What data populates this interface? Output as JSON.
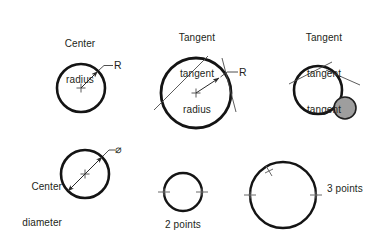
{
  "figure": {
    "title_visible": false,
    "background_color": "#ffffff",
    "stroke_color": "#1a1a1a",
    "thin_stroke_color": "#3b3b3b",
    "accent_fill_color": "#9e9e9e",
    "text_color": "#231f20"
  },
  "groups": [
    {
      "id": "center-radius",
      "caption_lines": [
        "Center",
        "radius"
      ],
      "dimension_label": "R",
      "circle": {
        "cx": 81,
        "cy": 88,
        "r": 24,
        "filled": false
      },
      "markers": [
        "center-cross"
      ],
      "leader": true
    },
    {
      "id": "tangent-tangent-radius",
      "caption_lines": [
        "Tangent",
        "tangent",
        "radius"
      ],
      "dimension_label": "R",
      "circle": {
        "cx": 196,
        "cy": 93,
        "r": 35,
        "filled": false
      },
      "markers": [
        "center-cross",
        "tangent-line-1",
        "tangent-line-2"
      ],
      "leader": true
    },
    {
      "id": "tangent-tangent-tangent",
      "caption_lines": [
        "Tangent",
        "tangent",
        "tangent"
      ],
      "dimension_label": "",
      "circle": {
        "cx": 318,
        "cy": 90,
        "r": 24,
        "filled": false
      },
      "small_circle": {
        "cx": 345,
        "cy": 108,
        "r": 11,
        "filled": true
      },
      "markers": [
        "tangent-line-1",
        "tangent-line-2"
      ],
      "leader": false
    },
    {
      "id": "center-diameter",
      "caption_lines": [
        "Center",
        "diameter"
      ],
      "dimension_label": "⌀",
      "circle": {
        "cx": 85,
        "cy": 174,
        "r": 24,
        "filled": false
      },
      "markers": [
        "center-cross",
        "diameter-double-arrow"
      ],
      "leader": true
    },
    {
      "id": "two-points",
      "caption_lines": [
        "2 points"
      ],
      "dimension_label": "",
      "circle": {
        "cx": 183,
        "cy": 192,
        "r": 19,
        "filled": false
      },
      "markers": [
        "tick-left",
        "tick-right"
      ],
      "leader": false
    },
    {
      "id": "three-points",
      "caption_lines": [
        "3 points"
      ],
      "dimension_label": "",
      "circle": {
        "cx": 283,
        "cy": 195,
        "r": 33,
        "filled": false
      },
      "markers": [
        "tick-left",
        "tick-right",
        "tick-upper-left"
      ],
      "leader": false
    }
  ],
  "labels": {
    "center_radius_line1": "Center",
    "center_radius_line2": "radius",
    "center_radius_r": "R",
    "tangent_tangent_radius_line1": "Tangent",
    "tangent_tangent_radius_line2": "tangent",
    "tangent_tangent_radius_line3": "radius",
    "tangent_tangent_radius_r": "R",
    "tangent_tangent_tangent_line1": "Tangent",
    "tangent_tangent_tangent_line2": "tangent",
    "tangent_tangent_tangent_line3": "tangent",
    "center_diameter_line1": "Center",
    "center_diameter_line2": "diameter",
    "center_diameter_symbol": "⌀",
    "two_points": "2 points",
    "three_points": "3 points"
  }
}
